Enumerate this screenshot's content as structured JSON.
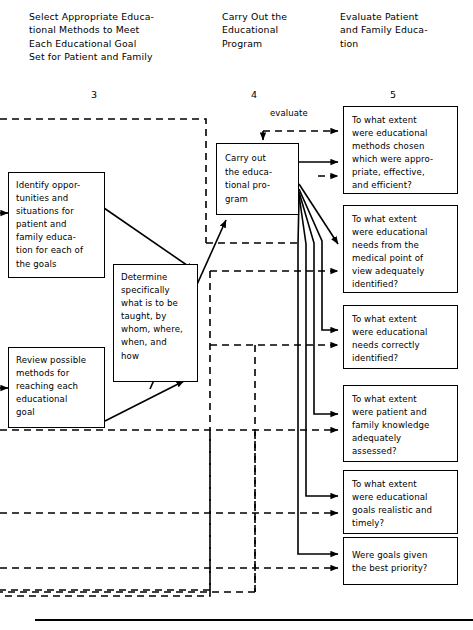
{
  "diagram": {
    "title_columns": [
      {
        "id": "col3",
        "number": "3",
        "heading": "Select Appropriate Educa-\ntional Methods to Meet\nEach  Educational Goal\n Set for Patient and Family"
      },
      {
        "id": "col4",
        "number": "4",
        "heading": "Carry Out the\nEducational\nProgram"
      },
      {
        "id": "col5",
        "number": "5",
        "heading": "Evaluate Patient\nand Family Educa-\ntion"
      }
    ],
    "process_boxes": [
      {
        "id": "identify-opportunities",
        "text": "Identify oppor-\ntunities and\nsituations for\npatient and\nfamily educa-\ntion for each of\nthe goals"
      },
      {
        "id": "review-methods",
        "text": "Review possible\nmethods for\nreaching each\neducational\ngoal"
      },
      {
        "id": "determine-specifically",
        "text": "Determine\nspecifically\nwhat is to be\ntaught, by\nwhom, where,\nwhen, and\nhow"
      },
      {
        "id": "carry-out-program",
        "text": "Carry out\nthe educa-\ntional pro-\ngram"
      }
    ],
    "evaluation_boxes": [
      {
        "id": "eval-methods",
        "text": "To what extent\nwere educational\nmethods chosen\nwhich were appro-\npriate, effective,\nand efficient?"
      },
      {
        "id": "eval-medical-needs",
        "text": "To what extent\nwere educational\nneeds from the\nmedical point of\nview adequately\nidentified?"
      },
      {
        "id": "eval-needs-correct",
        "text": "To what extent\nwere educational\nneeds correctly\nidentified?"
      },
      {
        "id": "eval-knowledge",
        "text": "To what extent\nwere patient and\nfamily knowledge\nadequately\nassessed?"
      },
      {
        "id": "eval-goals-realistic",
        "text": "To what extent\nwere educational\ngoals realistic and\ntimely?"
      },
      {
        "id": "eval-best-priority",
        "text": "Were goals given\nthe best priority?"
      }
    ],
    "edge_labels": {
      "evaluate": "evaluate"
    },
    "colors": {
      "ink": "#000000",
      "background": "#ffffff"
    }
  }
}
